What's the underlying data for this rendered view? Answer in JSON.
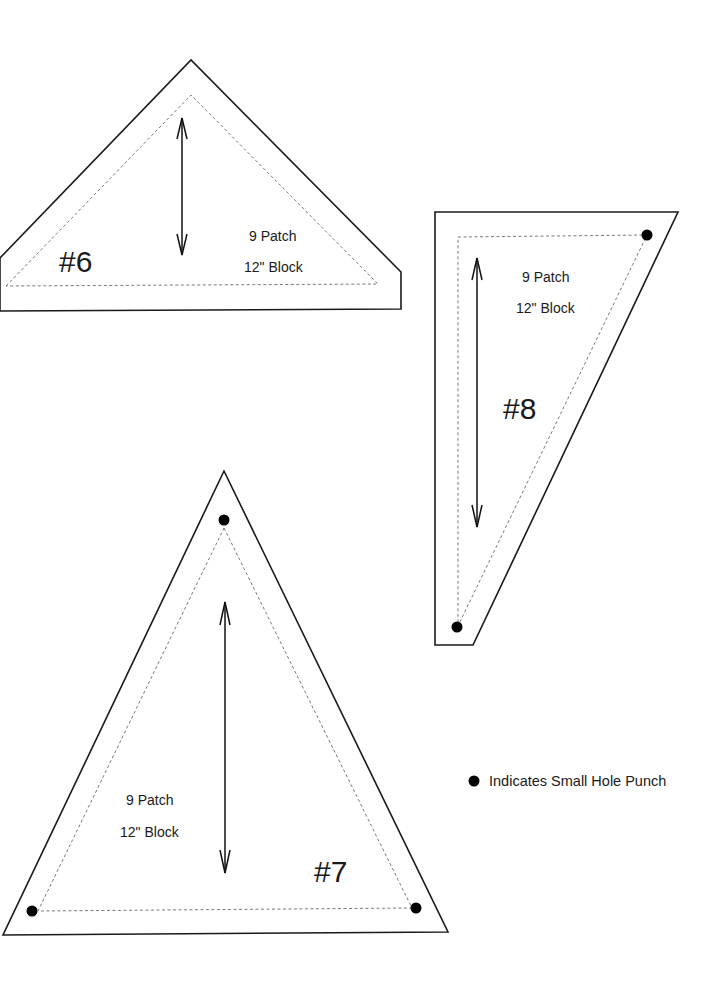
{
  "templates": [
    {
      "id": "6",
      "number_label": "#6",
      "text_line1": "9 Patch",
      "text_line2": "12\" Block",
      "hole_punches": 0
    },
    {
      "id": "8",
      "number_label": "#8",
      "text_line1": "9 Patch",
      "text_line2": "12\" Block",
      "hole_punches": 2
    },
    {
      "id": "7",
      "number_label": "#7",
      "text_line1": "9 Patch",
      "text_line2": "12\" Block",
      "hole_punches": 3
    }
  ],
  "legend": {
    "symbol": "filled-dot",
    "text": "Indicates Small Hole Punch"
  },
  "colors": {
    "line": "#1a1a1a",
    "seam": "#6a6a6a",
    "background": "#ffffff"
  }
}
